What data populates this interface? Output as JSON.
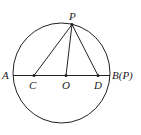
{
  "diagram": {
    "type": "geometry",
    "shape": "circle with diameter AB and center O",
    "points": {
      "A": {
        "label": "A",
        "x": 13,
        "y": 75
      },
      "B": {
        "label": "B(P)",
        "x": 110,
        "y": 75
      },
      "C": {
        "label": "C",
        "x": 34,
        "y": 75
      },
      "O": {
        "label": "O",
        "x": 66,
        "y": 75
      },
      "D": {
        "label": "D",
        "x": 98,
        "y": 75
      },
      "P": {
        "label": "P",
        "x": 72,
        "y": 24
      }
    },
    "segments": [
      "AB",
      "PC",
      "PO",
      "PD"
    ],
    "colors": {
      "stroke": "#222222",
      "background": "#ffffff"
    }
  }
}
